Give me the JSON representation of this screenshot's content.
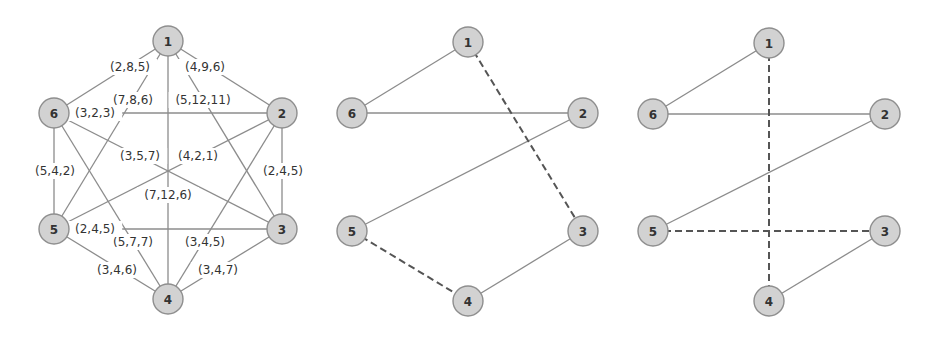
{
  "colors": {
    "node_fill": "#d2d2d2",
    "node_stroke": "#8e8e8e",
    "edge": "#8c8c8c",
    "dashed_edge": "#555555",
    "text": "#333333"
  },
  "graphs": [
    {
      "id": "complete-graph",
      "nodes": [
        {
          "id": "1",
          "label": "1",
          "x": 168,
          "y": 41
        },
        {
          "id": "2",
          "label": "2",
          "x": 282,
          "y": 113
        },
        {
          "id": "3",
          "label": "3",
          "x": 282,
          "y": 229
        },
        {
          "id": "4",
          "label": "4",
          "x": 168,
          "y": 299
        },
        {
          "id": "5",
          "label": "5",
          "x": 54,
          "y": 229
        },
        {
          "id": "6",
          "label": "6",
          "x": 54,
          "y": 113
        }
      ],
      "edges": [
        {
          "from": "1",
          "to": "6",
          "label": "(2,8,5)",
          "lx": 130,
          "ly": 67,
          "style": "solid"
        },
        {
          "from": "1",
          "to": "2",
          "label": "(4,9,6)",
          "lx": 205,
          "ly": 67,
          "style": "solid"
        },
        {
          "from": "1",
          "to": "5",
          "label": "(7,8,6)",
          "lx": 133,
          "ly": 100,
          "style": "solid"
        },
        {
          "from": "1",
          "to": "3",
          "label": "(5,12,11)",
          "lx": 203,
          "ly": 100,
          "style": "solid"
        },
        {
          "from": "1",
          "to": "4",
          "label": "(7,12,6)",
          "lx": 168,
          "ly": 195,
          "style": "solid"
        },
        {
          "from": "6",
          "to": "2",
          "label": "(3,2,3)",
          "lx": 95,
          "ly": 113,
          "style": "solid"
        },
        {
          "from": "6",
          "to": "3",
          "label": "(3,5,7)",
          "lx": 140,
          "ly": 156,
          "style": "solid"
        },
        {
          "from": "6",
          "to": "5",
          "label": "(5,4,2)",
          "lx": 55,
          "ly": 171,
          "style": "solid"
        },
        {
          "from": "6",
          "to": "4",
          "label": "(5,7,7)",
          "lx": 133,
          "ly": 242,
          "style": "solid"
        },
        {
          "from": "2",
          "to": "5",
          "label": "(4,2,1)",
          "lx": 198,
          "ly": 156,
          "style": "solid"
        },
        {
          "from": "2",
          "to": "3",
          "label": "(2,4,5)",
          "lx": 283,
          "ly": 171,
          "style": "solid"
        },
        {
          "from": "2",
          "to": "4",
          "label": "(3,4,5)",
          "lx": 205,
          "ly": 242,
          "style": "solid"
        },
        {
          "from": "5",
          "to": "3",
          "label": "(2,4,5)",
          "lx": 95,
          "ly": 229,
          "style": "solid"
        },
        {
          "from": "5",
          "to": "4",
          "label": "(3,4,6)",
          "lx": 117,
          "ly": 270,
          "style": "solid"
        },
        {
          "from": "3",
          "to": "4",
          "label": "(3,4,7)",
          "lx": 218,
          "ly": 270,
          "style": "solid"
        }
      ]
    },
    {
      "id": "solution-graph-a",
      "nodes": [
        {
          "id": "1",
          "label": "1",
          "x": 468,
          "y": 42
        },
        {
          "id": "2",
          "label": "2",
          "x": 583,
          "y": 113
        },
        {
          "id": "3",
          "label": "3",
          "x": 583,
          "y": 231
        },
        {
          "id": "4",
          "label": "4",
          "x": 468,
          "y": 301
        },
        {
          "id": "5",
          "label": "5",
          "x": 352,
          "y": 231
        },
        {
          "id": "6",
          "label": "6",
          "x": 352,
          "y": 113
        }
      ],
      "edges": [
        {
          "from": "1",
          "to": "6",
          "style": "solid"
        },
        {
          "from": "6",
          "to": "2",
          "style": "solid"
        },
        {
          "from": "2",
          "to": "5",
          "style": "solid"
        },
        {
          "from": "1",
          "to": "3",
          "style": "dashed"
        },
        {
          "from": "5",
          "to": "4",
          "style": "dashed"
        },
        {
          "from": "3",
          "to": "4",
          "style": "solid"
        }
      ]
    },
    {
      "id": "solution-graph-b",
      "nodes": [
        {
          "id": "1",
          "label": "1",
          "x": 769,
          "y": 43
        },
        {
          "id": "2",
          "label": "2",
          "x": 885,
          "y": 114
        },
        {
          "id": "3",
          "label": "3",
          "x": 885,
          "y": 231
        },
        {
          "id": "4",
          "label": "4",
          "x": 769,
          "y": 301
        },
        {
          "id": "5",
          "label": "5",
          "x": 653,
          "y": 231
        },
        {
          "id": "6",
          "label": "6",
          "x": 653,
          "y": 114
        }
      ],
      "edges": [
        {
          "from": "1",
          "to": "6",
          "style": "solid"
        },
        {
          "from": "6",
          "to": "2",
          "style": "solid"
        },
        {
          "from": "2",
          "to": "5",
          "style": "solid"
        },
        {
          "from": "1",
          "to": "4",
          "style": "dashed"
        },
        {
          "from": "5",
          "to": "3",
          "style": "dashed"
        },
        {
          "from": "3",
          "to": "4",
          "style": "solid"
        }
      ]
    }
  ],
  "node_radius": 15
}
